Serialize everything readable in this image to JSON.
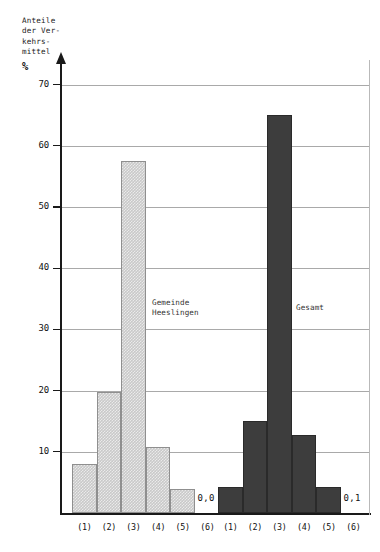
{
  "chart_data": {
    "type": "bar",
    "title": "",
    "ylabel": "Anteile der Verkehrsmittel",
    "ylabel_lines": [
      "Anteile",
      "der Ver-",
      "kehrs-",
      "mittel"
    ],
    "yunit": "%",
    "xlabel": "",
    "ylim": [
      0,
      70
    ],
    "yticks": [
      0,
      10,
      20,
      30,
      40,
      50,
      60,
      70
    ],
    "ytick_labels": [
      "",
      "10",
      "20",
      "30",
      "40",
      "50",
      "60",
      "70"
    ],
    "grid": true,
    "legend_position": "inline-annotation",
    "categories": [
      "(1)",
      "(2)",
      "(3)",
      "(4)",
      "(5)",
      "(6)"
    ],
    "series": [
      {
        "name": "Gemeinde Heeslingen",
        "name_lines": [
          "Gemeinde",
          "Heeslingen"
        ],
        "color": "#c9c9c9",
        "values": [
          8.0,
          19.8,
          57.5,
          10.8,
          3.9,
          0.0
        ],
        "value_annotations": [
          "",
          "",
          "",
          "",
          "",
          "0,0"
        ]
      },
      {
        "name": "Gesamt",
        "name_lines": [
          "Gesamt"
        ],
        "color": "#3d3d3d",
        "values": [
          4.3,
          15.0,
          65.0,
          12.8,
          4.3,
          0.1
        ],
        "value_annotations": [
          "",
          "",
          "",
          "",
          "",
          "0,1"
        ]
      }
    ]
  },
  "axis": {
    "y_caption_text": "Anteile\nder Ver-\nkehrs-\nmittel",
    "y_unit_text": "%"
  }
}
